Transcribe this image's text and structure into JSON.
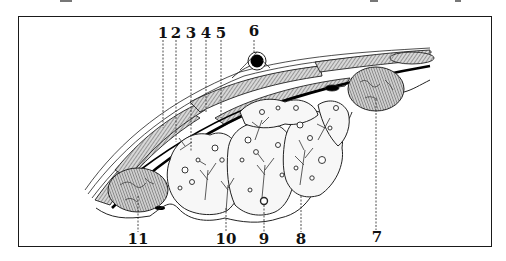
{
  "figure": {
    "type": "anatomical cross-section"
  },
  "labels": {
    "top": [
      {
        "id": "1",
        "text": "1",
        "x": 163
      },
      {
        "id": "2",
        "text": "2",
        "x": 176
      },
      {
        "id": "3",
        "text": "3",
        "x": 191
      },
      {
        "id": "4",
        "text": "4",
        "x": 206
      },
      {
        "id": "5",
        "text": "5",
        "x": 221
      },
      {
        "id": "6",
        "text": "6",
        "x": 254
      }
    ],
    "bottom": [
      {
        "id": "11",
        "text": "11",
        "x": 138
      },
      {
        "id": "10",
        "text": "10",
        "x": 226
      },
      {
        "id": "9",
        "text": "9",
        "x": 264
      },
      {
        "id": "8",
        "text": "8",
        "x": 301
      },
      {
        "id": "7",
        "text": "7",
        "x": 377
      }
    ]
  },
  "colors": {
    "ink": "#111111",
    "paper": "#ffffff",
    "muscle_fill": "#bdbdbd",
    "gland_fill": "#f7f7f7"
  }
}
